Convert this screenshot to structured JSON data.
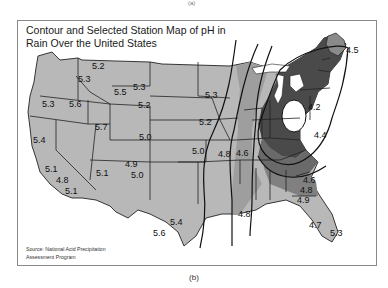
{
  "figure": {
    "top_mark": "(a)",
    "title_line1": "Contour and Selected Station Map of pH in",
    "title_line2": "Rain Over the United States",
    "source_line1": "Source: National Acid Precipitation",
    "source_line2": "Assessment Program",
    "caption": "(b)"
  },
  "colors": {
    "land_light": "#b8b8b8",
    "land_mid": "#8e8e8e",
    "land_dark": "#5a5a5a",
    "land_darkest": "#3c3c3c",
    "low_ph_core": "#ffffff",
    "contour": "#111111",
    "border": "#222222"
  },
  "stations": [
    {
      "region": "Montana-west",
      "value": "5.2"
    },
    {
      "region": "Idaho-north",
      "value": "5.3"
    },
    {
      "region": "Oregon",
      "value": "5.3"
    },
    {
      "region": "Idaho-south",
      "value": "5.6"
    },
    {
      "region": "Wyoming-northwest",
      "value": "5.5"
    },
    {
      "region": "Montana-east",
      "value": "5.3"
    },
    {
      "region": "Wyoming",
      "value": "5.2"
    },
    {
      "region": "Utah",
      "value": "5.7"
    },
    {
      "region": "Colorado",
      "value": "5.0"
    },
    {
      "region": "California-north",
      "value": "5.4"
    },
    {
      "region": "California-central",
      "value": "5.1"
    },
    {
      "region": "California-south-coast",
      "value": "4.8"
    },
    {
      "region": "California-south",
      "value": "5.1"
    },
    {
      "region": "Arizona",
      "value": "5.1"
    },
    {
      "region": "Four-corners",
      "value": "4.9"
    },
    {
      "region": "New-Mexico",
      "value": "5.0"
    },
    {
      "region": "Minnesota",
      "value": "5.3"
    },
    {
      "region": "Iowa",
      "value": "5.2"
    },
    {
      "region": "Kansas",
      "value": "5.0"
    },
    {
      "region": "Missouri",
      "value": "4.8"
    },
    {
      "region": "Illinois-south",
      "value": "4.6"
    },
    {
      "region": "Maine",
      "value": "4.5"
    },
    {
      "region": "Pennsylvania-NY",
      "value": "4.2"
    },
    {
      "region": "Virginia",
      "value": "4.4"
    },
    {
      "region": "Georgia-north",
      "value": "4.6"
    },
    {
      "region": "Georgia-central",
      "value": "4.8"
    },
    {
      "region": "Georgia-south",
      "value": "4.9"
    },
    {
      "region": "Louisiana",
      "value": "4.8"
    },
    {
      "region": "Florida-central",
      "value": "4.7"
    },
    {
      "region": "Florida-south",
      "value": "5.3"
    },
    {
      "region": "Texas-central",
      "value": "5.4"
    },
    {
      "region": "Texas-south",
      "value": "5.6"
    }
  ]
}
